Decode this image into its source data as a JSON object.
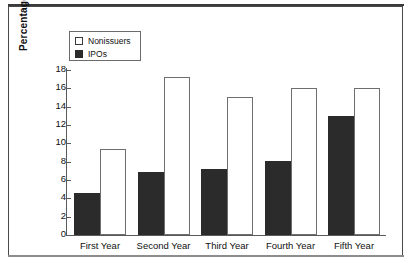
{
  "chart": {
    "ylabel": "Percentage Annual Return",
    "legend": {
      "items": [
        {
          "label": "Nonissuers",
          "swatch": "hollow-square-icon"
        },
        {
          "label": "IPOs",
          "swatch": "filled-square-icon"
        }
      ]
    }
  },
  "chart_data": {
    "type": "bar",
    "title": "",
    "xlabel": "",
    "ylabel": "Percentage Annual Return",
    "categories": [
      "First Year",
      "Second Year",
      "Third Year",
      "Fourth Year",
      "Fifth Year"
    ],
    "series": [
      {
        "name": "IPOs",
        "color": "#2b2b2b",
        "values": [
          4.6,
          6.9,
          7.2,
          8.1,
          13.0
        ]
      },
      {
        "name": "Nonissuers",
        "color": "#ffffff",
        "values": [
          9.4,
          17.2,
          15.1,
          16.0,
          16.0
        ]
      }
    ],
    "ylim": [
      0,
      18
    ],
    "yticks": [
      0,
      2,
      4,
      6,
      8,
      10,
      12,
      14,
      16,
      18
    ],
    "ytick_labels": [
      "0",
      "2",
      "4",
      "6",
      "8",
      "10",
      "12",
      "14",
      "16",
      "18"
    ],
    "grid": false,
    "legend_position": "upper-left"
  }
}
